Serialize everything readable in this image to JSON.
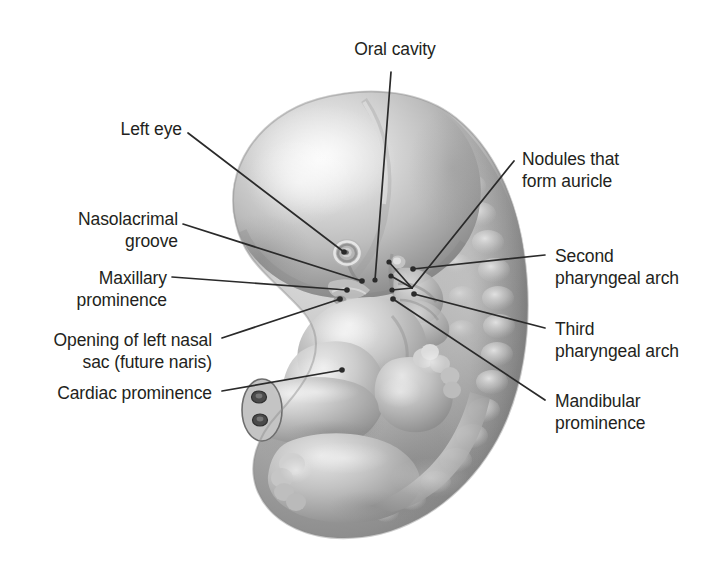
{
  "figure": {
    "title": "Oral cavity",
    "background_color": "#ffffff",
    "ink_color": "#231f20",
    "leader_color": "#2a2a2a"
  },
  "labels": {
    "oral_cavity": "Oral cavity",
    "left_eye": "Left eye",
    "nasolacrimal_groove_line1": "Nasolacrimal",
    "nasolacrimal_groove_line2": "groove",
    "maxillary_prominence_line1": "Maxillary",
    "maxillary_prominence_line2": "prominence",
    "nasal_sac_line1": "Opening of left nasal",
    "nasal_sac_line2": "sac (future naris)",
    "cardiac_prominence": "Cardiac prominence",
    "nodules_auricle_line1": "Nodules that",
    "nodules_auricle_line2": "form auricle",
    "second_arch_line1": "Second",
    "second_arch_line2": "pharyngeal arch",
    "third_arch_line1": "Third",
    "third_arch_line2": "pharyngeal arch",
    "mandibular_prominence_line1": "Mandibular",
    "mandibular_prominence_line2": "prominence"
  },
  "anatomy": {
    "forebrain_prominence": "forebrain / frontonasal prominence",
    "eye": "left eye (optic cup)",
    "otic_region": "nodules forming auricle",
    "arch_2": "second pharyngeal arch",
    "arch_3": "third pharyngeal arch",
    "mandible": "mandibular prominence",
    "maxilla": "maxillary prominence",
    "cardiac_bulge": "cardiac prominence",
    "umbilical_cord": "umbilical cord with two vessels",
    "upper_limb_bud": "upper limb bud with hand plate",
    "lower_limb_bud": "lower limb bud",
    "somites": "somite series along dorsal surface",
    "tail": "tail bud"
  }
}
